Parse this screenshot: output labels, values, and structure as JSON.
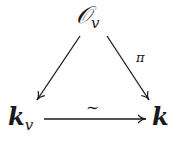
{
  "diagram": {
    "type": "commutative-triangle",
    "nodes": {
      "top": {
        "main": "𝒪",
        "sub": "v"
      },
      "left": {
        "main": "k",
        "sub": "v"
      },
      "right": {
        "main": "k",
        "sub": ""
      }
    },
    "arrows": [
      {
        "from": "top",
        "to": "left",
        "label": ""
      },
      {
        "from": "top",
        "to": "right",
        "label": "π"
      },
      {
        "from": "left",
        "to": "right",
        "label": "∼"
      }
    ]
  }
}
